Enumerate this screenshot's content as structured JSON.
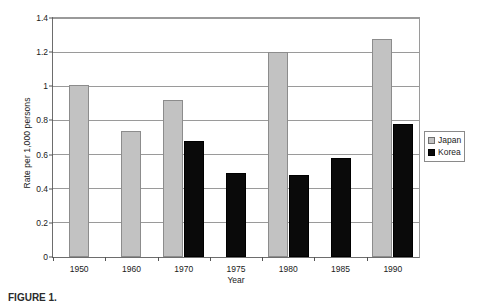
{
  "chart_data": {
    "type": "bar",
    "title": "",
    "xlabel": "Year",
    "ylabel": "Rate per 1,000 persons",
    "categories": [
      "1950",
      "1960",
      "1970",
      "1975",
      "1980",
      "1985",
      "1990"
    ],
    "series": [
      {
        "name": "Japan",
        "color": "#c2c2c2",
        "values": [
          1.01,
          0.74,
          0.92,
          null,
          1.2,
          null,
          1.28
        ]
      },
      {
        "name": "Korea",
        "color": "#0a0a0a",
        "values": [
          null,
          null,
          0.68,
          0.49,
          0.48,
          0.58,
          0.78
        ]
      }
    ],
    "ylim": [
      0,
      1.4
    ],
    "ytick_labels": [
      "0",
      "0.2",
      "0.4",
      "0.6",
      "0.8",
      "1",
      "1.2",
      "1.4"
    ],
    "ytick_values": [
      0,
      0.2,
      0.4,
      0.6,
      0.8,
      1.0,
      1.2,
      1.4
    ],
    "grid": true,
    "legend_position": "right"
  },
  "legend": {
    "entries": [
      {
        "label": "Japan",
        "swatch": "japan"
      },
      {
        "label": "Korea",
        "swatch": "korea"
      }
    ]
  },
  "caption": {
    "text": "FIGURE 1."
  }
}
